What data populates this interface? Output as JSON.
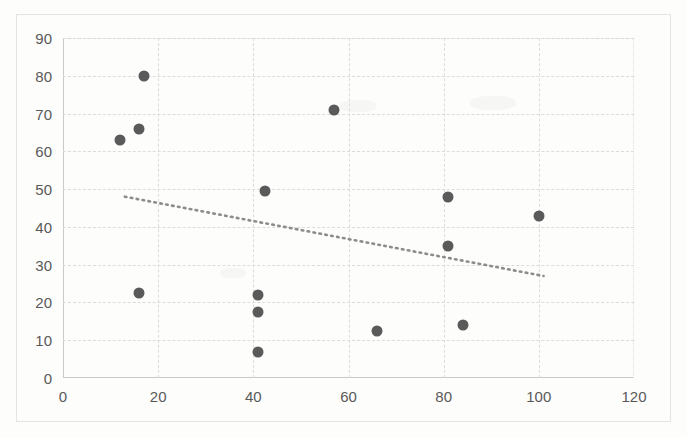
{
  "chart_data": {
    "type": "scatter",
    "title": "",
    "subtitle": "",
    "xlabel": "",
    "ylabel": "",
    "xlim": [
      0,
      120
    ],
    "ylim": [
      0,
      90
    ],
    "xticks": [
      0,
      20,
      40,
      60,
      80,
      100,
      120
    ],
    "yticks": [
      0,
      10,
      20,
      30,
      40,
      50,
      60,
      70,
      80,
      90
    ],
    "grid": true,
    "legend": "none",
    "marker_color": "#5a5a5a",
    "gridline_color": "#dcdcda",
    "axis_color": "#c9c9c7",
    "tick_label_color": "#595959",
    "series": [
      {
        "name": "points",
        "points": [
          {
            "x": 12,
            "y": 63
          },
          {
            "x": 16,
            "y": 66
          },
          {
            "x": 17,
            "y": 80
          },
          {
            "x": 16,
            "y": 22.5
          },
          {
            "x": 41,
            "y": 22
          },
          {
            "x": 41,
            "y": 17.5
          },
          {
            "x": 41,
            "y": 7
          },
          {
            "x": 42.5,
            "y": 49.5
          },
          {
            "x": 57,
            "y": 71
          },
          {
            "x": 66,
            "y": 12.5
          },
          {
            "x": 81,
            "y": 48
          },
          {
            "x": 81,
            "y": 35
          },
          {
            "x": 84,
            "y": 14
          },
          {
            "x": 100,
            "y": 43
          }
        ]
      }
    ],
    "trendline": {
      "type": "linear",
      "style": "dotted",
      "color": "#8c8c8c",
      "x_start": 13,
      "y_start": 48,
      "x_end": 101,
      "y_end": 27
    }
  },
  "axis": {
    "y_tick_labels": [
      "90",
      "80",
      "70",
      "60",
      "50",
      "40",
      "30",
      "20",
      "10",
      "0"
    ],
    "x_tick_labels": [
      "0",
      "20",
      "40",
      "60",
      "80",
      "100",
      "120"
    ]
  }
}
